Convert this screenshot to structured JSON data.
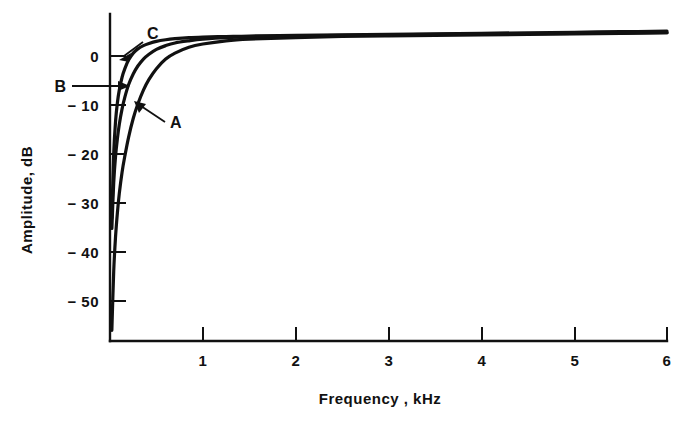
{
  "chart_data": {
    "type": "line",
    "title": "",
    "subtitle": "",
    "xlabel": "Frequency , kHz",
    "ylabel": "Amplitude, dB",
    "xlim": [
      0,
      6
    ],
    "ylim": [
      -57,
      4
    ],
    "grid": false,
    "legend_position": "inline-annotations",
    "x_ticks": [
      {
        "value": 1,
        "label": "1"
      },
      {
        "value": 2,
        "label": "2"
      },
      {
        "value": 3,
        "label": "3"
      },
      {
        "value": 4,
        "label": "4"
      },
      {
        "value": 5,
        "label": "5"
      },
      {
        "value": 6,
        "label": "6"
      }
    ],
    "y_ticks": [
      {
        "value": 0,
        "label": "0"
      },
      {
        "value": -10,
        "label": "− 10"
      },
      {
        "value": -20,
        "label": "− 20"
      },
      {
        "value": -30,
        "label": "− 30"
      },
      {
        "value": -40,
        "label": "− 40"
      },
      {
        "value": -50,
        "label": "− 50"
      }
    ],
    "annotations": [
      {
        "name": "A",
        "label": "A",
        "note": "lowest curve, widest rolloff knee"
      },
      {
        "name": "B",
        "label": "B",
        "note": "middle curve"
      },
      {
        "name": "C",
        "label": "C",
        "note": "uppermost curve, sharpest knee"
      }
    ],
    "series": [
      {
        "name": "A",
        "label": "A",
        "x": [
          0.02,
          0.04,
          0.06,
          0.08,
          0.1,
          0.13,
          0.16,
          0.2,
          0.25,
          0.3,
          0.36,
          0.42,
          0.5,
          0.6,
          0.7,
          0.85,
          1.0,
          1.25,
          1.5,
          2.0,
          2.5,
          3.0,
          3.5,
          4.0,
          4.5,
          5.0,
          5.5,
          6.0
        ],
        "values": [
          -55.0,
          -44.0,
          -37.5,
          -33.0,
          -29.5,
          -25.5,
          -22.5,
          -19.0,
          -15.5,
          -12.8,
          -10.2,
          -8.2,
          -6.2,
          -4.4,
          -3.3,
          -2.2,
          -1.6,
          -1.0,
          -0.7,
          -0.4,
          -0.2,
          -0.1,
          0.0,
          0.1,
          0.2,
          0.3,
          0.4,
          0.5
        ]
      },
      {
        "name": "B",
        "label": "B",
        "x": [
          0.02,
          0.04,
          0.06,
          0.08,
          0.1,
          0.13,
          0.16,
          0.2,
          0.25,
          0.3,
          0.36,
          0.42,
          0.5,
          0.6,
          0.7,
          0.85,
          1.0,
          1.25,
          1.5,
          2.0,
          2.5,
          3.0,
          3.5,
          4.0,
          4.5,
          5.0,
          5.5,
          6.0
        ],
        "values": [
          -36.0,
          -27.5,
          -22.5,
          -19.2,
          -16.6,
          -13.7,
          -11.5,
          -9.2,
          -7.2,
          -5.7,
          -4.4,
          -3.5,
          -2.6,
          -1.9,
          -1.4,
          -1.0,
          -0.7,
          -0.4,
          -0.3,
          -0.1,
          0.0,
          0.1,
          0.2,
          0.3,
          0.35,
          0.4,
          0.45,
          0.5
        ]
      },
      {
        "name": "C",
        "label": "C",
        "x": [
          0.02,
          0.04,
          0.06,
          0.08,
          0.1,
          0.13,
          0.16,
          0.2,
          0.25,
          0.3,
          0.36,
          0.42,
          0.5,
          0.6,
          0.7,
          0.85,
          1.0,
          1.25,
          1.5,
          2.0,
          2.5,
          3.0,
          3.5,
          4.0,
          4.5,
          5.0,
          5.5,
          6.0
        ],
        "values": [
          -34.0,
          -22.0,
          -16.0,
          -12.5,
          -10.2,
          -7.8,
          -6.2,
          -4.6,
          -3.3,
          -2.5,
          -1.9,
          -1.5,
          -1.1,
          -0.8,
          -0.6,
          -0.4,
          -0.3,
          -0.2,
          -0.1,
          0.0,
          0.1,
          0.2,
          0.3,
          0.4,
          0.5,
          0.6,
          0.7,
          0.8
        ]
      }
    ]
  }
}
